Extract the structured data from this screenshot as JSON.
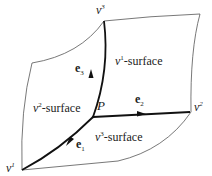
{
  "diagram": {
    "type": "coordinate-surfaces",
    "point_label": "P",
    "vertices": [
      {
        "id": "v1",
        "base": "v",
        "sup": "1"
      },
      {
        "id": "v2",
        "base": "v",
        "sup": "2"
      },
      {
        "id": "v3",
        "base": "v",
        "sup": "3"
      }
    ],
    "surfaces": [
      {
        "id": "s1",
        "base": "v",
        "sup": "1",
        "suffix": "-surface"
      },
      {
        "id": "s2",
        "base": "v",
        "sup": "2",
        "suffix": "-surface"
      },
      {
        "id": "s3",
        "base": "v",
        "sup": "3",
        "suffix": "-surface"
      }
    ],
    "basis_vectors": [
      {
        "id": "e1",
        "base": "e",
        "sub": "1"
      },
      {
        "id": "e2",
        "base": "e",
        "sub": "2"
      },
      {
        "id": "e3",
        "base": "e",
        "sub": "3"
      }
    ],
    "colors": {
      "thin_line": "#555555",
      "thick_line": "#111111",
      "text": "#222222"
    }
  }
}
